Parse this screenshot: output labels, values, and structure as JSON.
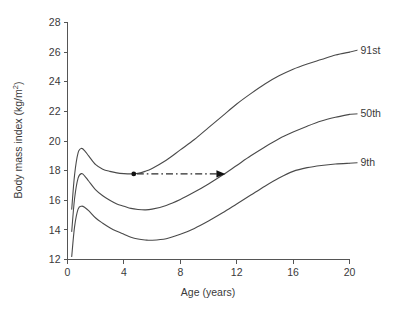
{
  "chart_data": {
    "type": "line",
    "title": "",
    "subtitle": "",
    "xlabel": "Age (years)",
    "ylabel": "Body mass index (kg/m²)",
    "ylabel_base": "Body mass index (kg/m",
    "ylabel_sup": "2",
    "ylabel_tail": ")",
    "xlim": [
      0,
      20
    ],
    "ylim": [
      12,
      28
    ],
    "xticks": [
      0,
      4,
      8,
      12,
      16,
      20
    ],
    "yticks": [
      12,
      14,
      16,
      18,
      20,
      22,
      24,
      26,
      28
    ],
    "xtick_labels": [
      "0",
      "4",
      "8",
      "12",
      "16",
      "20"
    ],
    "ytick_labels": [
      "12",
      "14",
      "16",
      "18",
      "20",
      "22",
      "24",
      "26",
      "28"
    ],
    "grid": false,
    "legend_position": "right-inline-labels",
    "series": [
      {
        "name": "91st",
        "label": "91st",
        "label_x": 20.6,
        "label_y": 26.2,
        "x": [
          0.3,
          0.5,
          0.75,
          1.0,
          1.25,
          1.5,
          2.0,
          2.5,
          3.0,
          3.5,
          4.0,
          4.5,
          5.0,
          5.5,
          6.0,
          7.0,
          8.0,
          9.0,
          10.0,
          11.0,
          12.0,
          13.0,
          14.0,
          15.0,
          16.0,
          17.0,
          18.0,
          19.0,
          20.0
        ],
        "y": [
          15.4,
          17.7,
          19.2,
          19.5,
          19.3,
          19.0,
          18.4,
          18.1,
          17.95,
          17.85,
          17.8,
          17.78,
          17.82,
          17.95,
          18.15,
          18.7,
          19.4,
          20.1,
          20.9,
          21.7,
          22.5,
          23.2,
          23.85,
          24.4,
          24.85,
          25.2,
          25.5,
          25.8,
          26.0
        ]
      },
      {
        "name": "50th",
        "label": "50th",
        "label_x": 20.6,
        "label_y": 21.9,
        "x": [
          0.3,
          0.5,
          0.75,
          1.0,
          1.25,
          1.5,
          2.0,
          2.5,
          3.0,
          3.5,
          4.0,
          4.5,
          5.0,
          5.5,
          6.0,
          7.0,
          8.0,
          9.0,
          10.0,
          11.0,
          12.0,
          13.0,
          14.0,
          15.0,
          16.0,
          17.0,
          18.0,
          19.0,
          20.0
        ],
        "y": [
          13.9,
          16.1,
          17.5,
          17.8,
          17.6,
          17.3,
          16.7,
          16.3,
          16.0,
          15.75,
          15.6,
          15.45,
          15.38,
          15.35,
          15.4,
          15.65,
          16.05,
          16.55,
          17.1,
          17.7,
          18.35,
          19.0,
          19.6,
          20.15,
          20.6,
          21.0,
          21.35,
          21.6,
          21.8
        ]
      },
      {
        "name": "9th",
        "label": "9th",
        "label_x": 20.6,
        "label_y": 18.6,
        "x": [
          0.3,
          0.5,
          0.75,
          1.0,
          1.25,
          1.5,
          2.0,
          2.5,
          3.0,
          3.5,
          4.0,
          4.5,
          5.0,
          5.5,
          6.0,
          7.0,
          8.0,
          9.0,
          10.0,
          11.0,
          12.0,
          13.0,
          14.0,
          15.0,
          16.0,
          17.0,
          18.0,
          19.0,
          20.0
        ],
        "y": [
          12.2,
          14.2,
          15.4,
          15.6,
          15.5,
          15.3,
          14.8,
          14.45,
          14.15,
          13.9,
          13.7,
          13.5,
          13.38,
          13.32,
          13.3,
          13.4,
          13.7,
          14.1,
          14.6,
          15.15,
          15.75,
          16.35,
          16.95,
          17.5,
          17.95,
          18.2,
          18.35,
          18.45,
          18.5
        ]
      }
    ],
    "annotations": [
      {
        "name": "tracking-arrow",
        "style": "dash-dot-with-arrowhead",
        "marker": "filled-circle",
        "from_x": 4.7,
        "from_y": 17.78,
        "to_x": 11.2,
        "to_y": 17.78
      }
    ]
  }
}
